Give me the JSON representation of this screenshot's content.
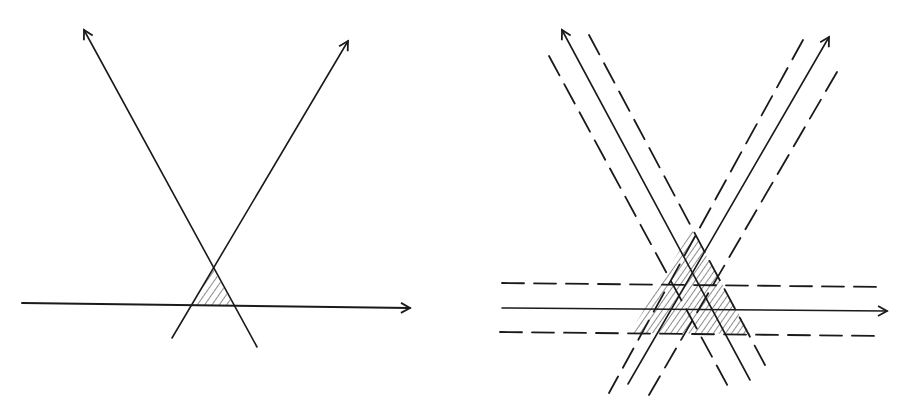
{
  "figure": {
    "panels": [
      {
        "id": "left",
        "description": "Two crossing lines and a horizontal line with the triangle between them hatched",
        "lines": [
          {
            "style": "solid",
            "from": [
              257,
              347
            ],
            "to": [
              84,
              30
            ],
            "arrow": true
          },
          {
            "style": "solid",
            "from": [
              172,
              338
            ],
            "to": [
              348,
              41
            ],
            "arrow": true
          },
          {
            "style": "solid",
            "from": [
              22,
              303
            ],
            "to": [
              410,
              308
            ],
            "arrow": true
          }
        ],
        "hatched_region": {
          "shape": "triangle",
          "vertices": [
            [
              213,
              268
            ],
            [
              193,
              305
            ],
            [
              233,
              306
            ]
          ]
        }
      },
      {
        "id": "right",
        "description": "Same three lines, each flanked by two parallel dashed lines; the enlarged triangular region is hatched",
        "lines": [
          {
            "style": "solid",
            "from": [
              750,
              380
            ],
            "to": [
              562,
              30
            ],
            "arrow": true
          },
          {
            "style": "solid",
            "from": [
              628,
              384
            ],
            "to": [
              829,
              37
            ],
            "arrow": true
          },
          {
            "style": "solid",
            "from": [
              502,
              308
            ],
            "to": [
              887,
              311
            ],
            "arrow": true
          }
        ],
        "dashed_lines": [
          {
            "from": [
              549,
              56
            ],
            "to": [
              730,
              390
            ]
          },
          {
            "from": [
              589,
              35
            ],
            "to": [
              765,
              365
            ]
          },
          {
            "from": [
              803,
              40
            ],
            "to": [
              609,
              393
            ]
          },
          {
            "from": [
              837,
              72
            ],
            "to": [
              649,
              395
            ]
          },
          {
            "from": [
              502,
              283
            ],
            "to": [
              881,
              287
            ]
          },
          {
            "from": [
              500,
              332
            ],
            "to": [
              881,
              336
            ]
          }
        ],
        "hatched_region": {
          "shape": "triangle",
          "vertices": [
            [
              692,
              230
            ],
            [
              630,
              333
            ],
            [
              750,
              334
            ]
          ]
        }
      }
    ]
  }
}
